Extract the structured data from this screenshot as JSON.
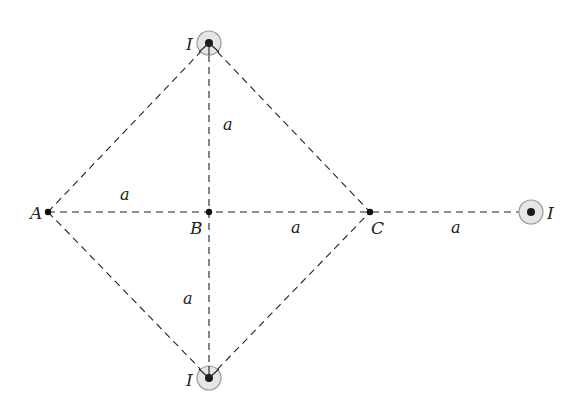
{
  "diagram": {
    "type": "physics-figure",
    "points": {
      "A": {
        "label": "A",
        "x": 48,
        "y": 212
      },
      "B": {
        "label": "B",
        "x": 209,
        "y": 212
      },
      "C": {
        "label": "C",
        "x": 370,
        "y": 212
      }
    },
    "wires": [
      {
        "id": "top",
        "label": "I",
        "x": 209,
        "y": 43,
        "direction": "out-of-page"
      },
      {
        "id": "bottom",
        "label": "I",
        "x": 209,
        "y": 378,
        "direction": "out-of-page"
      },
      {
        "id": "right",
        "label": "I",
        "x": 531,
        "y": 212,
        "direction": "out-of-page"
      }
    ],
    "distance_labels": [
      "a",
      "a",
      "a",
      "a",
      "a"
    ],
    "colors": {
      "line": "#222222",
      "wire_ring_fill": "#e6e6e6",
      "wire_ring_stroke": "#9a9a9a",
      "wire_dot": "#1a1a1a"
    }
  }
}
